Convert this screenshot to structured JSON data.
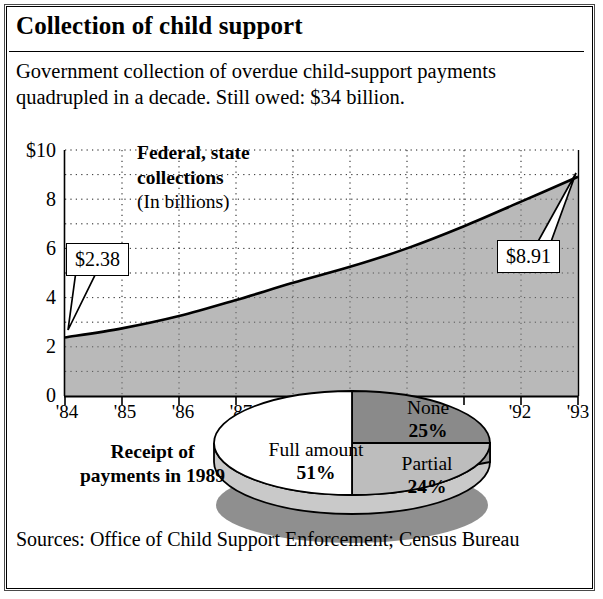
{
  "title": "Collection of child support",
  "subtitle": "Government collection of overdue child-support payments quadrupled in a decade. Still owed: $34 billion.",
  "sources": "Sources: Office of Child Support Enforcement; Census Bureau",
  "series_label": {
    "line1": "Federal, state",
    "line2": "collections",
    "units": "(In billions)"
  },
  "callouts": {
    "start": "$2.38",
    "end": "$8.91"
  },
  "pie_caption": {
    "line1": "Receipt of",
    "line2": "payments in 1989"
  },
  "colors": {
    "area_fill": "#b9b9b9",
    "pie_none": "#8a8a8a",
    "pie_partial": "#bdbdbd",
    "pie_full": "#ffffff",
    "shadow": "#8f8f8f",
    "stroke": "#000000"
  },
  "chart_data": [
    {
      "type": "area",
      "title": "Federal, state collections",
      "ylabel": "(In billions)",
      "xlabel": "",
      "categories": [
        "'84",
        "'85",
        "'86",
        "'87",
        "'88",
        "'89",
        "'90",
        "'91",
        "'92",
        "'93"
      ],
      "values": [
        2.38,
        2.75,
        3.25,
        3.9,
        4.6,
        5.25,
        6.0,
        6.9,
        7.9,
        8.91
      ],
      "ytick_labels": [
        "$10",
        "8",
        "6",
        "4",
        "2",
        "0"
      ],
      "ytick_values": [
        10,
        8,
        6,
        4,
        2,
        0
      ],
      "ylim": [
        0,
        10
      ],
      "minor_gridline_step": 1,
      "grid": "dotted",
      "annotations": [
        {
          "label": "$2.38",
          "x": "'84",
          "y": 2.38
        },
        {
          "label": "$8.91",
          "x": "'93",
          "y": 8.91
        }
      ]
    },
    {
      "type": "pie",
      "title": "Receipt of payments in 1989",
      "labels": [
        "Full amount",
        "None",
        "Partial"
      ],
      "values": [
        51,
        25,
        24
      ],
      "value_labels": [
        "51%",
        "25%",
        "24%"
      ],
      "legend": "none",
      "style": "3d"
    }
  ]
}
